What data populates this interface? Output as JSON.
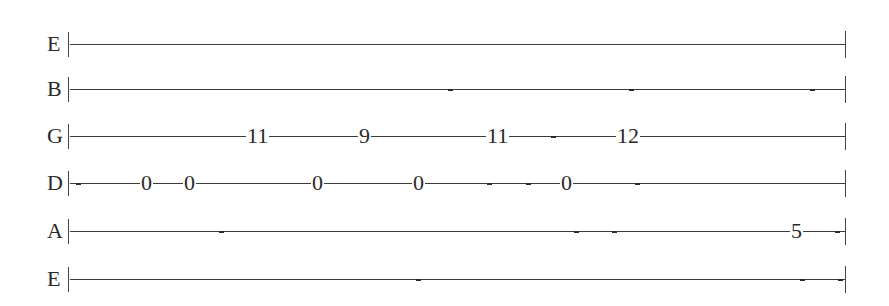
{
  "tablature": {
    "strings": [
      {
        "label": "E",
        "y": 44,
        "frets": [],
        "ticks": []
      },
      {
        "label": "B",
        "y": 89,
        "frets": [],
        "ticks": [
          448,
          629,
          810
        ]
      },
      {
        "label": "G",
        "y": 136,
        "frets": [
          {
            "value": "11",
            "x": 258
          },
          {
            "value": "9",
            "x": 364
          },
          {
            "value": "11",
            "x": 498
          },
          {
            "value": "12",
            "x": 628
          }
        ],
        "ticks": [
          551
        ]
      },
      {
        "label": "D",
        "y": 183,
        "frets": [
          {
            "value": "0",
            "x": 146
          },
          {
            "value": "0",
            "x": 189
          },
          {
            "value": "0",
            "x": 317
          },
          {
            "value": "0",
            "x": 418
          },
          {
            "value": "0",
            "x": 566
          }
        ],
        "ticks": [
          76,
          487,
          526,
          635
        ]
      },
      {
        "label": "A",
        "y": 231,
        "frets": [
          {
            "value": "5",
            "x": 796
          }
        ],
        "ticks": [
          219,
          574,
          612,
          835
        ]
      },
      {
        "label": "E",
        "y": 279,
        "frets": [],
        "ticks": [
          416,
          800,
          838
        ]
      }
    ],
    "line_start_x": 70,
    "line_end_x": 845
  }
}
